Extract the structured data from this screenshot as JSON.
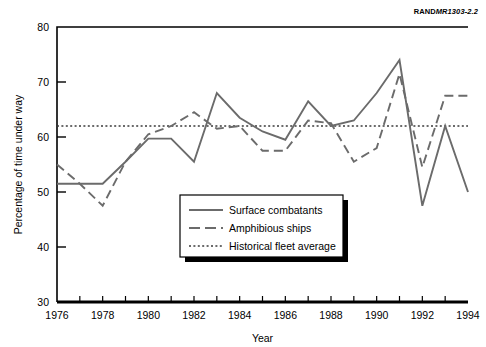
{
  "source_note": {
    "prefix": "RAND",
    "suffix": "MR1303-2.2"
  },
  "chart_data": {
    "type": "line",
    "title": "",
    "xlabel": "Year",
    "ylabel": "Percentage of time under way",
    "xlim": [
      1976,
      1994
    ],
    "ylim": [
      30,
      80
    ],
    "xticks": [
      1976,
      1978,
      1980,
      1982,
      1984,
      1986,
      1988,
      1990,
      1992,
      1994
    ],
    "xtick_labels": [
      "1976",
      "1978",
      "1980",
      "1982",
      "1984",
      "1986",
      "1988",
      "1990",
      "1992",
      "1994"
    ],
    "xminor_ticks": [
      1977,
      1979,
      1981,
      1983,
      1985,
      1987,
      1989,
      1991,
      1993
    ],
    "yticks": [
      30,
      40,
      50,
      60,
      70,
      80
    ],
    "ytick_labels": [
      "30",
      "40",
      "50",
      "60",
      "70",
      "80"
    ],
    "grid": false,
    "legend_position": "lower-center",
    "x": [
      1976,
      1977,
      1978,
      1979,
      1980,
      1981,
      1982,
      1983,
      1984,
      1985,
      1986,
      1987,
      1988,
      1989,
      1990,
      1991,
      1992,
      1993,
      1994
    ],
    "series": [
      {
        "name": "Surface combatants",
        "style": "solid",
        "color": "#6b6b6b",
        "values": [
          51.5,
          51.5,
          51.5,
          55.5,
          59.7,
          59.7,
          55.5,
          68.0,
          63.5,
          61.0,
          59.5,
          66.5,
          62.0,
          63.0,
          68.0,
          74.0,
          47.5,
          62.0,
          50.0
        ]
      },
      {
        "name": "Amphibious ships",
        "style": "dashed",
        "color": "#6b6b6b",
        "values": [
          55.0,
          51.5,
          47.5,
          55.5,
          60.5,
          62.0,
          64.5,
          61.5,
          62.0,
          57.5,
          57.5,
          63.0,
          62.5,
          55.5,
          58.0,
          71.5,
          54.5,
          67.5,
          67.5
        ]
      }
    ],
    "reference_line": {
      "name": "Historical fleet average",
      "style": "dotted",
      "color": "#3b3b3b",
      "value": 62.0
    },
    "legend": [
      {
        "label": "Surface combatants",
        "style": "solid"
      },
      {
        "label": "Amphibious ships",
        "style": "dashed"
      },
      {
        "label": "Historical fleet average",
        "style": "dotted"
      }
    ]
  }
}
